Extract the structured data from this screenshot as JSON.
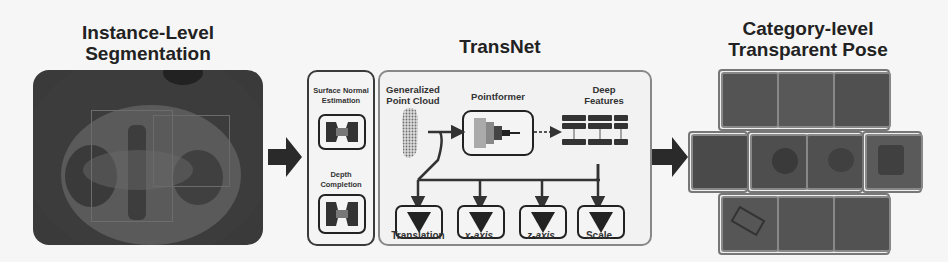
{
  "sections": {
    "segmentation": {
      "title_line1": "Instance-Level",
      "title_line2": "Segmentation"
    },
    "transnet": {
      "title": "TransNet",
      "preprocess": {
        "surface_normal_line1": "Surface Normal",
        "surface_normal_line2": "Estimation",
        "depth_completion_line1": "Depth",
        "depth_completion_line2": "Completion"
      },
      "point_cloud_line1": "Generalized",
      "point_cloud_line2": "Point Cloud",
      "pointformer": "Pointformer",
      "deep_features_line1": "Deep",
      "deep_features_line2": "Features",
      "heads": [
        "Translation",
        "x-axis",
        "z-axis",
        "Scale"
      ]
    },
    "pose": {
      "title_line1": "Category-level",
      "title_line2": "Transparent Pose"
    }
  },
  "colors": {
    "background": "#f6f6f6",
    "dark": "#2a2a2a",
    "gray_border": "#888888"
  }
}
